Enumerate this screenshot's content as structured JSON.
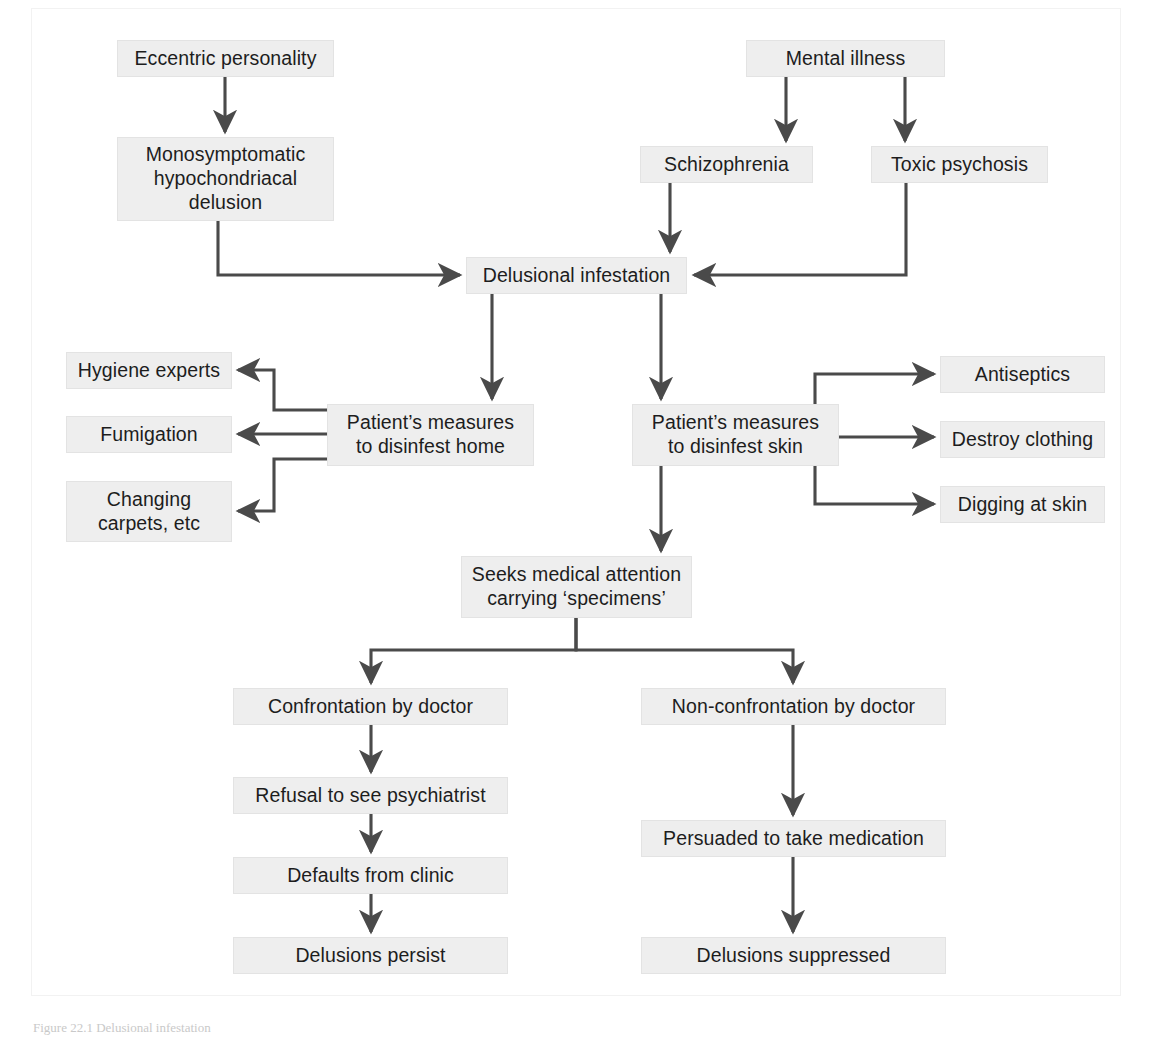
{
  "figure": {
    "caption": "Figure 22.1  Delusional infestation",
    "background_color": "#ffffff",
    "node_fill": "#eeeeee",
    "node_border": "#e3e3e3",
    "edge_color": "#4a4a4a",
    "text_color": "#1d1d1d"
  },
  "chart_data": {
    "type": "diagram",
    "nodes": [
      {
        "id": "eccentric",
        "label": "Eccentric personality",
        "x": 117,
        "y": 40,
        "w": 217,
        "h": 37
      },
      {
        "id": "mental",
        "label": "Mental illness",
        "x": 746,
        "y": 40,
        "w": 199,
        "h": 37
      },
      {
        "id": "mono",
        "label": "Monosymptomatic\nhypochondriacal\ndelusion",
        "x": 117,
        "y": 137,
        "w": 217,
        "h": 84
      },
      {
        "id": "schizo",
        "label": "Schizophrenia",
        "x": 640,
        "y": 146,
        "w": 173,
        "h": 37
      },
      {
        "id": "toxic",
        "label": "Toxic psychosis",
        "x": 871,
        "y": 146,
        "w": 177,
        "h": 37
      },
      {
        "id": "delusional",
        "label": "Delusional infestation",
        "x": 466,
        "y": 257,
        "w": 221,
        "h": 37
      },
      {
        "id": "hygiene",
        "label": "Hygiene experts",
        "x": 66,
        "y": 352,
        "w": 166,
        "h": 37
      },
      {
        "id": "fumigation",
        "label": "Fumigation",
        "x": 66,
        "y": 416,
        "w": 166,
        "h": 37
      },
      {
        "id": "carpets",
        "label": "Changing\ncarpets, etc",
        "x": 66,
        "y": 481,
        "w": 166,
        "h": 61
      },
      {
        "id": "home",
        "label": "Patient’s measures\nto disinfest home",
        "x": 327,
        "y": 404,
        "w": 207,
        "h": 62
      },
      {
        "id": "skin",
        "label": "Patient’s measures\nto disinfest skin",
        "x": 632,
        "y": 404,
        "w": 207,
        "h": 62
      },
      {
        "id": "antiseptics",
        "label": "Antiseptics",
        "x": 940,
        "y": 356,
        "w": 165,
        "h": 37
      },
      {
        "id": "clothing",
        "label": "Destroy clothing",
        "x": 940,
        "y": 421,
        "w": 165,
        "h": 37
      },
      {
        "id": "digging",
        "label": "Digging at skin",
        "x": 940,
        "y": 486,
        "w": 165,
        "h": 37
      },
      {
        "id": "seeks",
        "label": "Seeks medical attention\ncarrying ‘specimens’",
        "x": 461,
        "y": 556,
        "w": 231,
        "h": 62
      },
      {
        "id": "confrontation",
        "label": "Confrontation by doctor",
        "x": 233,
        "y": 688,
        "w": 275,
        "h": 37
      },
      {
        "id": "nonconfrontation",
        "label": "Non-confrontation by doctor",
        "x": 641,
        "y": 688,
        "w": 305,
        "h": 37
      },
      {
        "id": "refusal",
        "label": "Refusal to see psychiatrist",
        "x": 233,
        "y": 777,
        "w": 275,
        "h": 37
      },
      {
        "id": "persuaded",
        "label": "Persuaded to take medication",
        "x": 641,
        "y": 820,
        "w": 305,
        "h": 37
      },
      {
        "id": "defaults",
        "label": "Defaults from clinic",
        "x": 233,
        "y": 857,
        "w": 275,
        "h": 37
      },
      {
        "id": "persist",
        "label": "Delusions persist",
        "x": 233,
        "y": 937,
        "w": 275,
        "h": 37
      },
      {
        "id": "suppressed",
        "label": "Delusions suppressed",
        "x": 641,
        "y": 937,
        "w": 305,
        "h": 37
      }
    ],
    "edges": [
      {
        "from": "eccentric",
        "to": "mono",
        "style": "straight-down"
      },
      {
        "from": "mental",
        "to": "schizo",
        "style": "elbow-down-left"
      },
      {
        "from": "mental",
        "to": "toxic",
        "style": "elbow-down-right"
      },
      {
        "from": "mono",
        "to": "delusional",
        "style": "elbow-down-right-into-left"
      },
      {
        "from": "schizo",
        "to": "delusional",
        "style": "straight-down"
      },
      {
        "from": "toxic",
        "to": "delusional",
        "style": "elbow-down-left-into-right"
      },
      {
        "from": "delusional",
        "to": "home",
        "style": "straight-down"
      },
      {
        "from": "delusional",
        "to": "skin",
        "style": "straight-down"
      },
      {
        "from": "home",
        "to": "hygiene",
        "style": "elbow-up-left"
      },
      {
        "from": "home",
        "to": "fumigation",
        "style": "straight-left"
      },
      {
        "from": "home",
        "to": "carpets",
        "style": "elbow-down-left"
      },
      {
        "from": "skin",
        "to": "antiseptics",
        "style": "elbow-up-right"
      },
      {
        "from": "skin",
        "to": "clothing",
        "style": "straight-right"
      },
      {
        "from": "skin",
        "to": "digging",
        "style": "elbow-down-right"
      },
      {
        "from": "skin",
        "to": "seeks",
        "style": "straight-down"
      },
      {
        "from": "seeks",
        "to": "confrontation",
        "style": "split-down-left"
      },
      {
        "from": "seeks",
        "to": "nonconfrontation",
        "style": "split-down-right"
      },
      {
        "from": "confrontation",
        "to": "refusal",
        "style": "straight-down"
      },
      {
        "from": "refusal",
        "to": "defaults",
        "style": "straight-down"
      },
      {
        "from": "defaults",
        "to": "persist",
        "style": "straight-down"
      },
      {
        "from": "nonconfrontation",
        "to": "persuaded",
        "style": "straight-down"
      },
      {
        "from": "persuaded",
        "to": "suppressed",
        "style": "straight-down"
      }
    ]
  }
}
